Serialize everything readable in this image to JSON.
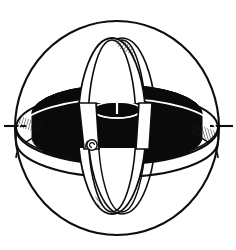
{
  "figure": {
    "name": "gyroscope-diagram",
    "title": "Gyroscope in gimbal sphere",
    "style": "black-and-white technical line drawing",
    "width": 236,
    "height": 250
  },
  "colors": {
    "background": "#ffffff",
    "stroke": "#0d0d0d",
    "rotor_fill": "#0a0a0a",
    "ring_fill": "#ffffff",
    "hatch": "#1a1a1a"
  },
  "geometry": {
    "sphere": {
      "label": "outer-sphere-circle",
      "cx": 117,
      "cy": 128,
      "rx": 102,
      "ry": 107,
      "stroke_width": 2.0
    },
    "horizontal_gimbal": {
      "label": "horizontal-gimbal-ring",
      "cx": 117,
      "cy": 128,
      "rx": 101,
      "ry": 36,
      "band_height": 34,
      "stroke_width": 2.0
    },
    "vertical_gimbal": {
      "label": "vertical-gimbal-ring",
      "cx": 117,
      "cy": 126,
      "rx": 35,
      "ry": 88,
      "band_width": 16,
      "stroke_width": 1.8
    },
    "rotor": {
      "label": "flywheel-rotor-disk",
      "cx": 117,
      "cy": 114,
      "rx": 85,
      "ry": 29,
      "thickness": 33,
      "fill": "#0a0a0a"
    },
    "hub": {
      "label": "rotor-hub-ring",
      "cx": 117,
      "cy": 110,
      "rx": 24,
      "ry": 8
    },
    "spin_axis": {
      "label": "vertical-spin-axis",
      "x": 117,
      "y_top": 40,
      "y_bottom": 212
    },
    "pivots": [
      {
        "label": "left-pivot-tick",
        "x1": 4,
        "x2": 26,
        "y": 126
      },
      {
        "label": "right-pivot-tick",
        "x1": 210,
        "x2": 232,
        "y": 126
      }
    ],
    "hatch_patches": [
      {
        "label": "hatch-top-apex",
        "x": 116,
        "y": 38
      },
      {
        "label": "hatch-bottom-apex",
        "x": 112,
        "y": 208
      },
      {
        "label": "hatch-left-bearing",
        "x": 26,
        "y": 120
      },
      {
        "label": "hatch-right-bearing",
        "x": 196,
        "y": 126
      }
    ],
    "detail_knob": {
      "label": "lower-left-scroll-knob",
      "cx": 92,
      "cy": 145,
      "r": 5
    }
  }
}
